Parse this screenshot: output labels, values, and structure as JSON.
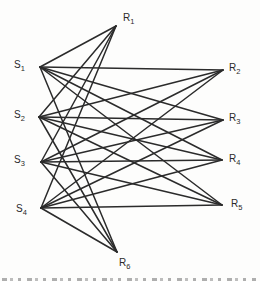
{
  "diagram": {
    "type": "bipartite-graph",
    "stroke_color": "#2b2b2b",
    "stroke_width": 1.5,
    "background": "#fdfdfc",
    "left_nodes": [
      {
        "id": "S1",
        "base": "S",
        "sub": "1",
        "x": 40,
        "y": 67,
        "label_x": 14,
        "label_y": 60
      },
      {
        "id": "S2",
        "base": "S",
        "sub": "2",
        "x": 39,
        "y": 117,
        "label_x": 14,
        "label_y": 110
      },
      {
        "id": "S3",
        "base": "S",
        "sub": "3",
        "x": 41,
        "y": 162,
        "label_x": 14,
        "label_y": 155
      },
      {
        "id": "S4",
        "base": "S",
        "sub": "4",
        "x": 41,
        "y": 208,
        "label_x": 16,
        "label_y": 204
      }
    ],
    "right_nodes": [
      {
        "id": "R1",
        "base": "R",
        "sub": "1",
        "x": 116,
        "y": 26,
        "label_x": 123,
        "label_y": 13
      },
      {
        "id": "R2",
        "base": "R",
        "sub": "2",
        "x": 223,
        "y": 70,
        "label_x": 229,
        "label_y": 63
      },
      {
        "id": "R3",
        "base": "R",
        "sub": "3",
        "x": 223,
        "y": 120,
        "label_x": 229,
        "label_y": 113
      },
      {
        "id": "R4",
        "base": "R",
        "sub": "4",
        "x": 222,
        "y": 160,
        "label_x": 229,
        "label_y": 154
      },
      {
        "id": "R5",
        "base": "R",
        "sub": "5",
        "x": 222,
        "y": 205,
        "label_x": 231,
        "label_y": 199
      },
      {
        "id": "R6",
        "base": "R",
        "sub": "6",
        "x": 117,
        "y": 252,
        "label_x": 119,
        "label_y": 258
      }
    ],
    "edges": [
      [
        "S1",
        "R1"
      ],
      [
        "S1",
        "R2"
      ],
      [
        "S1",
        "R3"
      ],
      [
        "S1",
        "R4"
      ],
      [
        "S1",
        "R5"
      ],
      [
        "S1",
        "R6"
      ],
      [
        "S2",
        "R1"
      ],
      [
        "S2",
        "R2"
      ],
      [
        "S2",
        "R3"
      ],
      [
        "S2",
        "R4"
      ],
      [
        "S2",
        "R5"
      ],
      [
        "S2",
        "R6"
      ],
      [
        "S3",
        "R1"
      ],
      [
        "S3",
        "R2"
      ],
      [
        "S3",
        "R3"
      ],
      [
        "S3",
        "R4"
      ],
      [
        "S3",
        "R5"
      ],
      [
        "S3",
        "R6"
      ],
      [
        "S4",
        "R1"
      ],
      [
        "S4",
        "R2"
      ],
      [
        "S4",
        "R3"
      ],
      [
        "S4",
        "R4"
      ],
      [
        "S4",
        "R5"
      ],
      [
        "S4",
        "R6"
      ]
    ]
  }
}
